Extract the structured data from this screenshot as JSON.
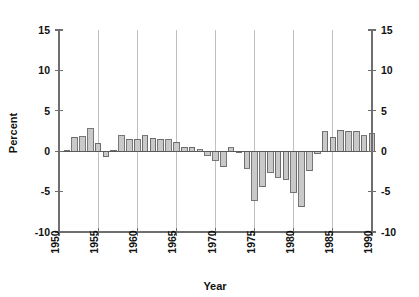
{
  "chart_data": {
    "type": "bar",
    "title": "",
    "xlabel": "Year",
    "ylabel": "Percent",
    "xlim": [
      1950,
      1990
    ],
    "ylim": [
      -10,
      15
    ],
    "ytick_labels_left": [
      "15",
      "10",
      "5",
      "0",
      "-5",
      "-10"
    ],
    "ytick_labels_right": [
      "15",
      "10",
      "5",
      "0",
      "-5",
      "-10"
    ],
    "ytick_values": [
      15,
      10,
      5,
      0,
      -5,
      -10
    ],
    "xtick_labels": [
      "1950",
      "1955",
      "1960",
      "1965",
      "1970",
      "1975",
      "1980",
      "1985",
      "1990"
    ],
    "xtick_values": [
      1950,
      1955,
      1960,
      1965,
      1970,
      1975,
      1980,
      1985,
      1990
    ],
    "grid": "vertical-only",
    "legend": "none",
    "bar_fill_color": "#c9c9c9",
    "bar_edge_color": "#555555",
    "axis_color": "#6e6e6e",
    "gridline_color": "#b9b9b9",
    "x": [
      1951,
      1952,
      1953,
      1954,
      1955,
      1956,
      1957,
      1958,
      1959,
      1960,
      1961,
      1962,
      1963,
      1964,
      1965,
      1966,
      1967,
      1968,
      1969,
      1970,
      1971,
      1972,
      1973,
      1974,
      1975,
      1976,
      1977,
      1978,
      1979,
      1980,
      1981,
      1982,
      1983,
      1984,
      1985,
      1986,
      1987,
      1988,
      1989,
      1990
    ],
    "values": [
      0.1,
      1.7,
      1.8,
      2.8,
      1.0,
      -0.7,
      0.1,
      1.9,
      1.5,
      1.5,
      1.9,
      1.6,
      1.5,
      1.4,
      1.1,
      0.5,
      0.5,
      0.2,
      -0.5,
      -1.1,
      -1.9,
      0.4,
      -0.2,
      -2.1,
      -6.1,
      -4.4,
      -2.6,
      -3.2,
      -3.5,
      -5.1,
      -6.9,
      -2.4,
      -0.3,
      2.4,
      1.7,
      2.6,
      2.5,
      2.5,
      1.9,
      2.2
    ],
    "series": [
      {
        "name": "Percent",
        "values": [
          0.1,
          1.7,
          1.8,
          2.8,
          1.0,
          -0.7,
          0.1,
          1.9,
          1.5,
          1.5,
          1.9,
          1.6,
          1.5,
          1.4,
          1.1,
          0.5,
          0.5,
          0.2,
          -0.5,
          -1.1,
          -1.9,
          0.4,
          -0.2,
          -2.1,
          -6.1,
          -4.4,
          -2.6,
          -3.2,
          -3.5,
          -5.1,
          -6.9,
          -2.4,
          -0.3,
          2.4,
          1.7,
          2.6,
          2.5,
          2.5,
          1.9,
          2.2
        ]
      }
    ]
  }
}
